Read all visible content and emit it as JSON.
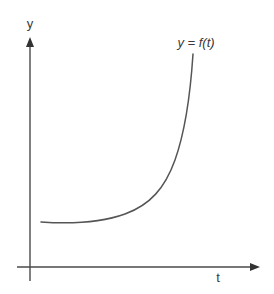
{
  "diagram": {
    "type": "function-graph",
    "y_axis_label": "y",
    "x_axis_label": "t",
    "curve_label": "y = f(t)",
    "colors": {
      "axis": "#4a4a4a",
      "curve": "#555555",
      "text": "#3a3a3a",
      "background": "#ffffff"
    },
    "curve_shape": "exponential-like growth: nearly flat near a positive minimum, then rising steeply"
  }
}
